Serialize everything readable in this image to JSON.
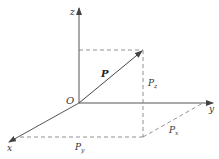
{
  "diagram": {
    "title": "",
    "type": "3D vector decomposition",
    "axes": {
      "z": {
        "label": "z"
      },
      "y": {
        "label": "y"
      },
      "x": {
        "label": "x"
      }
    },
    "origin": {
      "label": "O"
    },
    "vector": {
      "label": "P"
    },
    "components": {
      "pz": {
        "base": "P",
        "sub": "z"
      },
      "px": {
        "base": "P",
        "sub": "x"
      },
      "py": {
        "base": "P",
        "sub": "y"
      }
    },
    "colors": {
      "line": "#555555",
      "dashed": "#777777",
      "background": "#ffffff"
    }
  }
}
